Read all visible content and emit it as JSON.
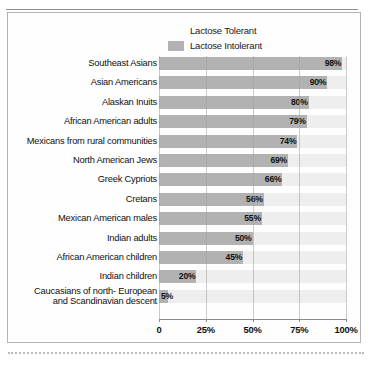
{
  "chart_data": {
    "type": "bar",
    "orientation": "horizontal",
    "title": "",
    "xlabel": "",
    "ylabel": "",
    "xlim": [
      0,
      100
    ],
    "xticks": [
      0,
      25,
      50,
      75,
      100
    ],
    "xticklabels": [
      "0",
      "25%",
      "50%",
      "75%",
      "100%"
    ],
    "grid": true,
    "legend_position": "top",
    "legend": [
      {
        "label": "Lactose Tolerant",
        "color": "#ffffff",
        "swatch": "tolerant"
      },
      {
        "label": "Lactose Intolerant",
        "color": "#b2b2b2",
        "swatch": "intolerant"
      }
    ],
    "categories": [
      "Southeast Asians",
      "Asian Americans",
      "Alaskan Inuits",
      "African American adults",
      "Mexicans from rural communities",
      "North American Jews",
      "Greek Cypriots",
      "Cretans",
      "Mexican American males",
      "Indian adults",
      "African American children",
      "Indian children",
      "Caucasians of north- European\nand Scandinavian descent"
    ],
    "values": [
      98,
      90,
      80,
      79,
      74,
      69,
      66,
      56,
      55,
      50,
      45,
      20,
      5
    ],
    "value_labels": [
      "98%",
      "90%",
      "80%",
      "79%",
      "74%",
      "69%",
      "66%",
      "56%",
      "55%",
      "50%",
      "45%",
      "20%",
      "5%"
    ],
    "series": [
      {
        "name": "Lactose Intolerant",
        "values": [
          98,
          90,
          80,
          79,
          74,
          69,
          66,
          56,
          55,
          50,
          45,
          20,
          5
        ]
      },
      {
        "name": "Lactose Tolerant",
        "values": [
          2,
          10,
          20,
          21,
          26,
          31,
          34,
          44,
          45,
          50,
          55,
          80,
          95
        ]
      }
    ],
    "colors": {
      "intolerant": "#b2b2b2",
      "tolerant": "#eeeeee",
      "text": "#101010",
      "frame": "#b3b3b3",
      "gridline": "#a0a0a0"
    }
  }
}
